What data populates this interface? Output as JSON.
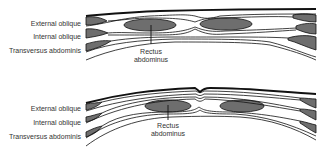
{
  "colors": {
    "muscle_fill": "#6e6e6e",
    "line": "#111111",
    "text": "#333333",
    "background": "#ffffff"
  },
  "panels": [
    {
      "id": "top",
      "labels": {
        "external_oblique": "External oblique",
        "internal_oblique": "Internal oblique",
        "transversus_abdominis": "Transversus abdominis",
        "rectus_abdominus": [
          "Rectus",
          "abdominus"
        ]
      }
    },
    {
      "id": "bottom",
      "labels": {
        "external_oblique": "External oblique",
        "internal_oblique": "Internal oblique",
        "transversus_abdominis": "Transversus abdominis",
        "rectus_abdominus": [
          "Rectus",
          "abdominus"
        ]
      }
    }
  ]
}
